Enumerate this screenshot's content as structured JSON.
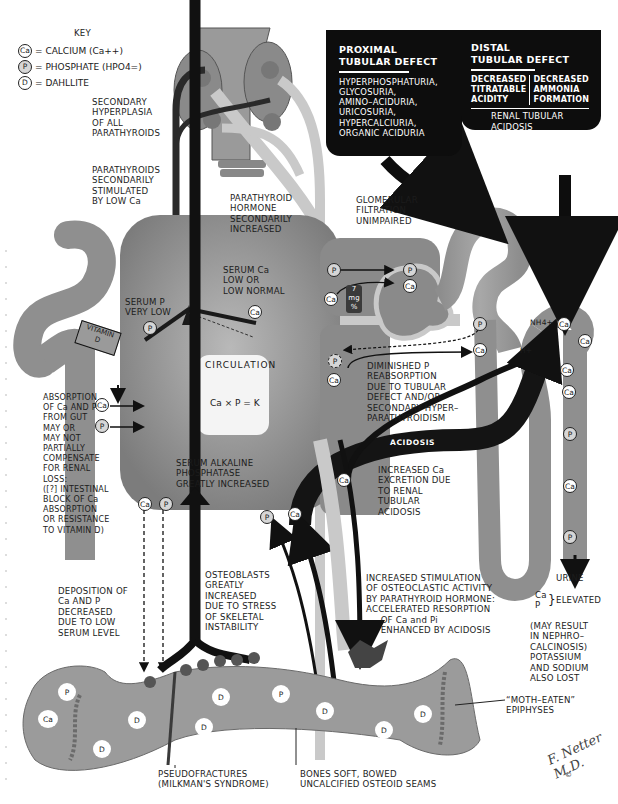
{
  "key": {
    "title": "KEY",
    "items": [
      {
        "symbol": "Ca",
        "text": "= CALCIUM (Ca++)"
      },
      {
        "symbol": "P",
        "text": "= PHOSPHATE (HPO4=)"
      },
      {
        "symbol": "D",
        "text": "= DAHLLITE"
      }
    ]
  },
  "parathyroid": {
    "hyperplasia": "SECONDARY\nHYPERPLASIA\nOF ALL\nPARATHYROIDS",
    "stimulated": "PARATHYROIDS\nSECONDARILY\nSTIMULATED\nBY LOW Ca",
    "hormone": "PARATHYROID\nHORMONE\nSECONDARILY\nINCREASED"
  },
  "proximal_box": {
    "title": "PROXIMAL\nTUBULAR DEFECT",
    "body": "HYPERPHOSPHATURIA,\nGLYCOSURIA,\nAMINO–ACIDURIA,\nURICOSURIA,\nHYPERCALCIURIA,\nORGANIC ACIDURIA"
  },
  "distal_box": {
    "title": "DISTAL\nTUBULAR DEFECT",
    "col1": "DECREASED\nTITRATABLE\nACIDITY",
    "col2": "DECREASED\nAMMONIA\nFORMATION",
    "result": "RENAL TUBULAR\nACIDOSIS"
  },
  "circulation": {
    "title": "CIRCULATION",
    "equation": "Ca × P = K",
    "serum_ca": "SERUM Ca\nLOW OR\nLOW NORMAL",
    "serum_p": "SERUM P\nVERY LOW",
    "alk_phos": "SERUM ALKALINE\nPHOSPHATASE\nGREATLY INCREASED",
    "serum_ca_level": {
      "value": "7",
      "unit": "mg",
      "suffix": "%"
    }
  },
  "kidney": {
    "glomerular": "GLOMERULAR\nFILTRATION\nUNIMPAIRED",
    "diminished_p": "DIMINISHED P\nREABSORPTION\nDUE TO TUBULAR\nDEFECT AND/OR\nSECONDARY HYPER–\nPARATHYROIDISM",
    "acidosis_label": "ACIDOSIS",
    "increased_ca": "INCREASED Ca\nEXCRETION DUE\nTO RENAL\nTUBULAR\nACIDOSIS",
    "nh4": "NH4+",
    "h": "H+",
    "urine": "URINE",
    "elevated": "ELEVATED",
    "elevated_ions": "Ca\nP",
    "nephro": "(MAY RESULT\nIN NEPHRO–\nCALCINOSIS)\nPOTASSIUM\nAND SODIUM\nALSO LOST"
  },
  "gut": {
    "vitamin_d": "VITAMIN\nD",
    "absorption": "ABSORPTION\nOF Ca AND P\nFROM GUT\nMAY OR\nMAY NOT\nPARTIALLY\nCOMPENSATE\nFOR RENAL\nLOSS:\n([?] INTESTINAL\nBLOCK OF Ca\nABSORPTION\nOR RESISTANCE\nTO VITAMIN D)"
  },
  "bone": {
    "deposition": "DEPOSITION OF\nCa AND P\nDECREASED\nDUE TO LOW\nSERUM LEVEL",
    "osteoblasts": "OSTEOBLASTS\nGREATLY\nINCREASED\nDUE TO STRESS\nOF SKELETAL\nINSTABILITY",
    "osteoclastic": "INCREASED STIMULATION\nOF OSTEOCLASTIC ACTIVITY\nBY PARATHYROID HORMONE:\nACCELERATED RESORPTION\n     OF Ca and Pi\n     ENHANCED BY ACIDOSIS",
    "moth_eaten": "“MOTH–EATEN”\nEPIPHYSES",
    "pseudofractures": "PSEUDOFRACTURES\n(MILKMAN'S SYNDROME)",
    "bones_soft": "BONES SOFT, BOWED\nUNCALCIFIED OSTEOID SEAMS"
  },
  "ion_labels": {
    "ca": "Ca",
    "p": "P",
    "d": "D"
  },
  "signature": "F. Netter M.D.",
  "copyright": "©",
  "colors": {
    "background": "#ffffff",
    "black_box": "#0d0d0d",
    "circulation_gray": "#8e8e8e",
    "tissue_gray": "#9a9a9a",
    "light_stream": "#c9c9c9",
    "text": "#1c1c1c"
  }
}
